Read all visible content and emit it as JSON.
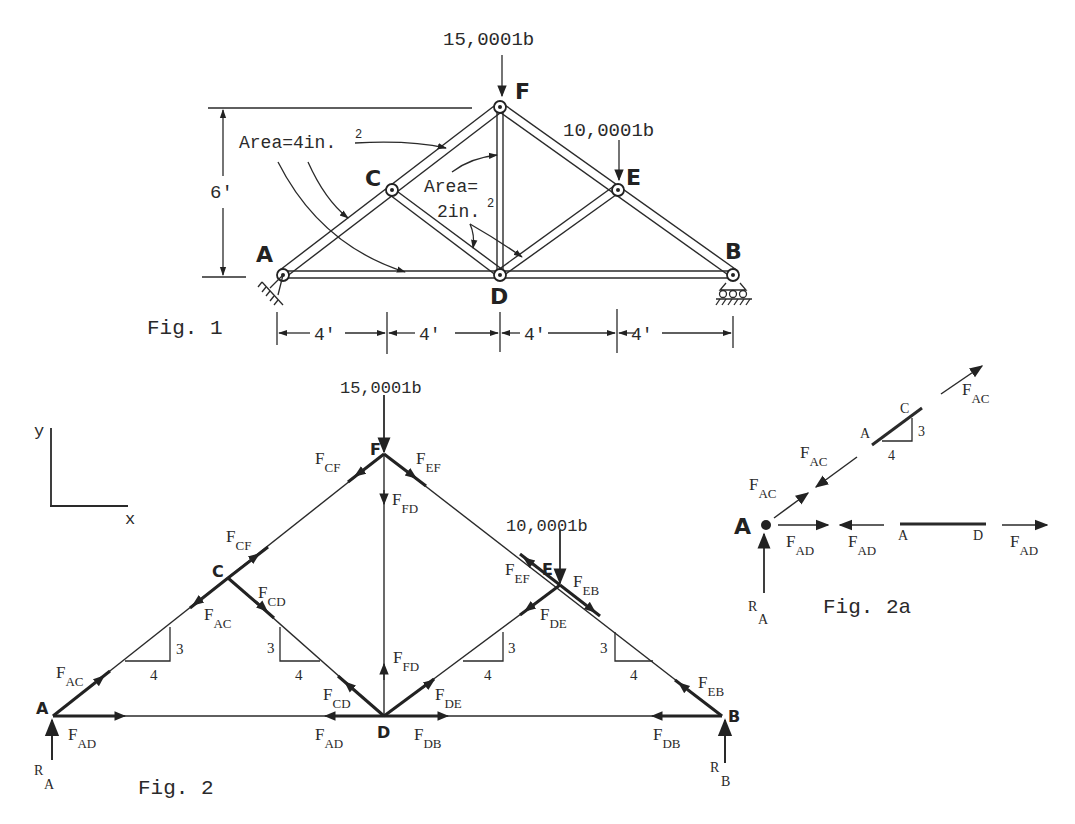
{
  "fig1": {
    "caption": "Fig. 1",
    "loads": {
      "F": "15,0001b",
      "E": "10,0001b"
    },
    "joints": [
      "A",
      "B",
      "C",
      "D",
      "E",
      "F"
    ],
    "height_dim": "6'",
    "span_dims": [
      "4'",
      "4'",
      "4'",
      "4'"
    ],
    "area_chords": "Area=4in.",
    "area_chords_sup": "2",
    "area_webs_l1": "Area=",
    "area_webs_l2": "2in.",
    "area_webs_sup": "2"
  },
  "fig2": {
    "caption": "Fig. 2",
    "axes": {
      "y": "y",
      "x": "x"
    },
    "loads": {
      "F": "15,0001b",
      "E": "10,0001b"
    },
    "joints": [
      "A",
      "B",
      "C",
      "D",
      "E",
      "F"
    ],
    "slope": {
      "rise": "3",
      "run": "4"
    },
    "forces": [
      {
        "id": "cf_top",
        "F": "F",
        "sub": "CF"
      },
      {
        "id": "ef_top",
        "F": "F",
        "sub": "EF"
      },
      {
        "id": "fd_top",
        "F": "F",
        "sub": "FD"
      },
      {
        "id": "cf_c",
        "F": "F",
        "sub": "CF"
      },
      {
        "id": "cd_c",
        "F": "F",
        "sub": "CD"
      },
      {
        "id": "ac_c",
        "F": "F",
        "sub": "AC"
      },
      {
        "id": "ef_e",
        "F": "F",
        "sub": "EF"
      },
      {
        "id": "eb_e",
        "F": "F",
        "sub": "EB"
      },
      {
        "id": "de_e",
        "F": "F",
        "sub": "DE"
      },
      {
        "id": "ac_a",
        "F": "F",
        "sub": "AC"
      },
      {
        "id": "ad_a",
        "F": "F",
        "sub": "AD"
      },
      {
        "id": "cd_d",
        "F": "F",
        "sub": "CD"
      },
      {
        "id": "fd_d",
        "F": "F",
        "sub": "FD"
      },
      {
        "id": "de_d",
        "F": "F",
        "sub": "DE"
      },
      {
        "id": "ad_d",
        "F": "F",
        "sub": "AD"
      },
      {
        "id": "db_d",
        "F": "F",
        "sub": "DB"
      },
      {
        "id": "db_b",
        "F": "F",
        "sub": "DB"
      },
      {
        "id": "eb_b",
        "F": "F",
        "sub": "EB"
      }
    ],
    "reactions": {
      "A": {
        "R": "R",
        "sub": "A"
      },
      "B": {
        "R": "R",
        "sub": "B"
      }
    }
  },
  "fig2a": {
    "caption": "Fig. 2a",
    "joint": "A",
    "member_ac": {
      "start": "A",
      "end": "C",
      "rise": "3",
      "run": "4"
    },
    "member_ad": {
      "start": "A",
      "end": "D"
    },
    "forces": [
      {
        "id": "ac_top",
        "F": "F",
        "sub": "AC"
      },
      {
        "id": "ac_mid",
        "F": "F",
        "sub": "AC"
      },
      {
        "id": "ac_joint",
        "F": "F",
        "sub": "AC"
      },
      {
        "id": "ad_joint",
        "F": "F",
        "sub": "AD"
      },
      {
        "id": "ad_left",
        "F": "F",
        "sub": "AD"
      },
      {
        "id": "ad_right",
        "F": "F",
        "sub": "AD"
      }
    ],
    "reaction": {
      "R": "R",
      "sub": "A"
    }
  }
}
